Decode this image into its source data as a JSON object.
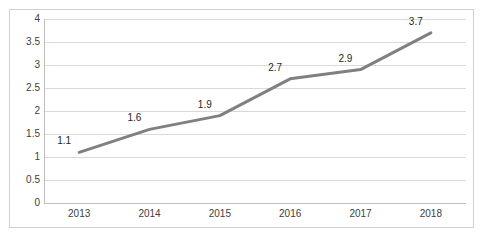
{
  "chart_data": {
    "type": "line",
    "title": "",
    "subtitle": "",
    "xlabel": "",
    "ylabel": "",
    "categories": [
      "2013",
      "2014",
      "2015",
      "2016",
      "2017",
      "2018"
    ],
    "values": [
      1.1,
      1.6,
      1.9,
      2.7,
      2.9,
      3.7
    ],
    "data_labels": [
      "1.1",
      "1.6",
      "1.9",
      "2.7",
      "2.9",
      "3.7"
    ],
    "series": [
      {
        "name": "",
        "values": [
          1.1,
          1.6,
          1.9,
          2.7,
          2.9,
          3.7
        ]
      }
    ],
    "ylim": [
      0,
      4
    ],
    "y_ticks": [
      0,
      0.5,
      1,
      1.5,
      2,
      2.5,
      3,
      3.5,
      4
    ],
    "y_tick_labels": [
      "0",
      "0.5",
      "1",
      "1.5",
      "2",
      "2.5",
      "3",
      "3.5",
      "4"
    ],
    "x_tick_labels": [
      "2013",
      "2014",
      "2015",
      "2016",
      "2017",
      "2018"
    ],
    "grid": {
      "horizontal": true,
      "vertical": false
    },
    "legend": {
      "visible": false,
      "position": "none",
      "entries": []
    },
    "markers": false,
    "annotations": []
  },
  "style": {
    "line_color": "#808080",
    "line_width": 3,
    "grid_color": "#d9d9d9",
    "axis_color": "#bfbfbf",
    "border_color": "#d0d0d0",
    "background_color": "#ffffff",
    "tick_label_color": "#404040",
    "data_label_color": "#262626"
  }
}
